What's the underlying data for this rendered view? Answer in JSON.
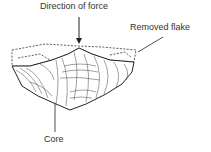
{
  "labels": {
    "force": "Direction of force",
    "flake": "Removed flake",
    "core": "Core"
  }
}
